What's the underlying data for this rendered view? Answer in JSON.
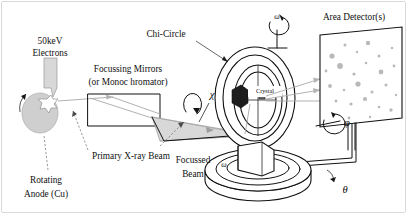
{
  "figure": {
    "width": 407,
    "height": 215,
    "background": "#ffffff",
    "ink_color": "#111111",
    "beam_color": "#a8a8a8",
    "spot_color": "#b9b9b9",
    "anode_color": "#cfcfcf"
  },
  "labels": {
    "electrons_line1": "50keV",
    "electrons_line2": "Electrons",
    "mirrors_line1": "Focussing Mirrors",
    "mirrors_line2": "(or Monoc hromator)",
    "primary_beam": "Primary X-ray Beam",
    "rotating_anode_line1": "Rotating",
    "rotating_anode_line2": "Anode (Cu)",
    "focussed_beam_line1": "Focussed",
    "focussed_beam_line2": "Beam",
    "chi_circle": "Chi-Circle",
    "crystal": "Crystal",
    "area_detector": "Area Detector(s)"
  },
  "symbols": {
    "chi": "χ",
    "omega_top": "ω",
    "omega_base": "ω",
    "phi": "φ",
    "theta": "θ"
  },
  "components": [
    {
      "name": "rotating-anode",
      "label": "Rotating Anode (Cu)"
    },
    {
      "name": "electron-beam",
      "label": "50keV Electrons"
    },
    {
      "name": "focussing-mirrors",
      "label": "Focussing Mirrors (or Monoc hromator)"
    },
    {
      "name": "primary-xray-beam",
      "label": "Primary X-ray Beam"
    },
    {
      "name": "focussed-beam",
      "label": "Focussed Beam"
    },
    {
      "name": "chi-circle",
      "label": "Chi-Circle"
    },
    {
      "name": "crystal",
      "label": "Crystal"
    },
    {
      "name": "area-detector",
      "label": "Area Detector(s)"
    },
    {
      "name": "goniometer-base",
      "label": "Goniometer base"
    }
  ],
  "axes": [
    {
      "name": "chi-axis",
      "symbol": "χ"
    },
    {
      "name": "omega-axis-top",
      "symbol": "ω"
    },
    {
      "name": "omega-axis-base",
      "symbol": "ω"
    },
    {
      "name": "phi-axis",
      "symbol": "φ"
    },
    {
      "name": "theta-axis",
      "symbol": "θ"
    }
  ],
  "detector_spots": [
    {
      "cx": 332,
      "cy": 56,
      "r": 2.6
    },
    {
      "cx": 345,
      "cy": 45,
      "r": 1.5
    },
    {
      "cx": 357,
      "cy": 52,
      "r": 1.2
    },
    {
      "cx": 368,
      "cy": 43,
      "r": 2.2
    },
    {
      "cx": 379,
      "cy": 56,
      "r": 1.5
    },
    {
      "cx": 392,
      "cy": 48,
      "r": 1.3
    },
    {
      "cx": 326,
      "cy": 71,
      "r": 1.4
    },
    {
      "cx": 340,
      "cy": 66,
      "r": 2.9
    },
    {
      "cx": 354,
      "cy": 74,
      "r": 1.6
    },
    {
      "cx": 366,
      "cy": 63,
      "r": 1.3
    },
    {
      "cx": 381,
      "cy": 72,
      "r": 2.4
    },
    {
      "cx": 394,
      "cy": 66,
      "r": 1.4
    },
    {
      "cx": 330,
      "cy": 86,
      "r": 1.9
    },
    {
      "cx": 344,
      "cy": 90,
      "r": 1.3
    },
    {
      "cx": 358,
      "cy": 84,
      "r": 2.6
    },
    {
      "cx": 372,
      "cy": 92,
      "r": 1.5
    },
    {
      "cx": 386,
      "cy": 85,
      "r": 1.5
    },
    {
      "cx": 396,
      "cy": 95,
      "r": 1.2
    },
    {
      "cx": 336,
      "cy": 101,
      "r": 1.4
    },
    {
      "cx": 351,
      "cy": 104,
      "r": 1.6
    },
    {
      "cx": 365,
      "cy": 99,
      "r": 2.1
    },
    {
      "cx": 379,
      "cy": 107,
      "r": 1.3
    },
    {
      "cx": 391,
      "cy": 110,
      "r": 1.7
    },
    {
      "cx": 349,
      "cy": 118,
      "r": 1.4
    },
    {
      "cx": 370,
      "cy": 117,
      "r": 1.2
    }
  ]
}
